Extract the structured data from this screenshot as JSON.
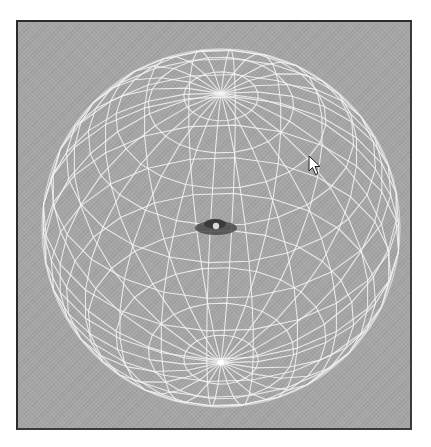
{
  "viewport": {
    "background_color": "#a6a6a6",
    "border_color": "#2a2a2a",
    "wireframe_color": "#f4f4f4"
  },
  "scene": {
    "object": "wireframe-sphere",
    "latitude_rings": 15,
    "longitude_meridians": 24,
    "view": "slightly from below, south pole visible",
    "center_object": "dark disc with light center"
  },
  "cursor": {
    "icon": "arrow-pointer-icon",
    "x": 308,
    "y": 155
  },
  "caption": {
    "text": ""
  }
}
